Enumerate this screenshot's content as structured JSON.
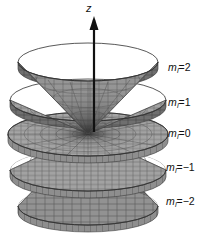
{
  "figure": {
    "background_color": "#ffffff",
    "width": 221,
    "height": 239,
    "axis": {
      "name": "z-axis",
      "label": "z",
      "label_x": 88,
      "label_y": 4,
      "arrow_tip_y": 20,
      "line_x": 94,
      "line_bottom_y": 132,
      "color": "#111111"
    },
    "surface": {
      "fill_color": "#9a9a9a",
      "fill_light": "#b5b5b5",
      "fill_dark": "#6e6e6e",
      "grid_color": "#4a4a4a",
      "edge_color": "#3a3a3a",
      "interior_shadow": "#3c3c3c"
    },
    "apex": {
      "x": 88,
      "y": 134
    },
    "cones": [
      {
        "name": "cone-ml-2",
        "m_l": 2,
        "label": "m",
        "subscript": "l",
        "equals_value": "=2",
        "label_x": 168,
        "label_y": 62,
        "direction": "up",
        "rim_y": 62,
        "rim_rx": 70,
        "rim_ry": 19,
        "thickness": 7
      },
      {
        "name": "cone-ml-1",
        "m_l": 1,
        "label": "m",
        "subscript": "l",
        "equals_value": "=1",
        "label_x": 168,
        "label_y": 97,
        "direction": "up",
        "rim_y": 100,
        "rim_rx": 78,
        "rim_ry": 21,
        "thickness": 7
      },
      {
        "name": "cone-ml-0",
        "m_l": 0,
        "label": "m",
        "subscript": "l",
        "equals_value": "=0",
        "label_x": 168,
        "label_y": 128,
        "direction": "flat",
        "rim_y": 134,
        "rim_rx": 80,
        "rim_ry": 22,
        "thickness": 7
      },
      {
        "name": "cone-ml-minus-1",
        "m_l": -1,
        "label": "m",
        "subscript": "l",
        "equals_value": "=−1",
        "label_x": 168,
        "label_y": 162,
        "direction": "down",
        "rim_y": 170,
        "rim_rx": 78,
        "rim_ry": 21,
        "thickness": 7
      },
      {
        "name": "cone-ml-minus-2",
        "m_l": -2,
        "label": "m",
        "subscript": "l",
        "equals_value": "=−2",
        "label_x": 168,
        "label_y": 196,
        "direction": "down",
        "rim_y": 206,
        "rim_rx": 70,
        "rim_ry": 19,
        "thickness": 7
      }
    ]
  }
}
